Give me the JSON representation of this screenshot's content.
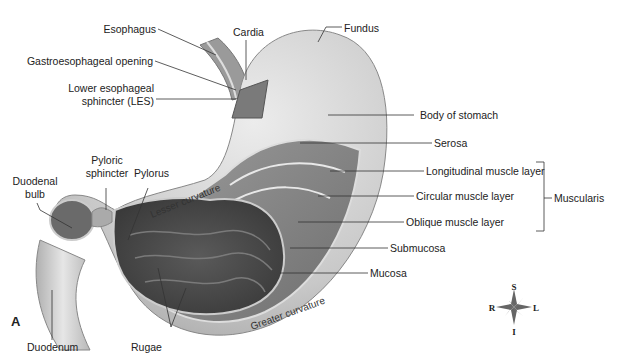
{
  "figure_letter": "A",
  "labels": {
    "esophagus": "Esophagus",
    "cardia": "Cardia",
    "fundus": "Fundus",
    "gastroesophageal_opening": "Gastroesophageal opening",
    "les_line1": "Lower esophageal",
    "les_line2": "sphincter (LES)",
    "body": "Body of stomach",
    "serosa": "Serosa",
    "longitudinal": "Longitudinal muscle layer",
    "circular": "Circular muscle layer",
    "oblique": "Oblique muscle layer",
    "muscularis": "Muscularis",
    "submucosa": "Submucosa",
    "mucosa": "Mucosa",
    "pyloric_line1": "Pyloric",
    "pyloric_line2": "sphincter",
    "pylorus": "Pylorus",
    "duodenal_line1": "Duodenal",
    "duodenal_line2": "bulb",
    "duodenum": "Duodenum",
    "rugae": "Rugae",
    "lesser_curvature": "Lesser curvature",
    "greater_curvature": "Greater curvature"
  },
  "compass": {
    "s": "S",
    "i": "I",
    "r": "R",
    "l": "L"
  }
}
